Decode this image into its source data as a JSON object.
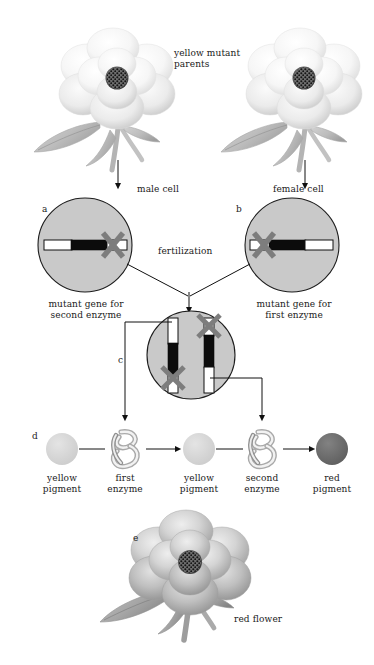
{
  "figure": {
    "domain": "biology-genetics-diagram",
    "title_note": "Complementation of two yellow mutant parents producing a red-flowered offspring"
  },
  "labels": {
    "parents": "yellow mutant\nparents",
    "male_cell": "male cell",
    "female_cell": "female cell",
    "fertilization": "fertilization",
    "mutant_second": "mutant gene for\nsecond enzyme",
    "mutant_first": "mutant gene for\nfirst enzyme",
    "red_flower": "red flower"
  },
  "panel_tags": {
    "a": "a",
    "b": "b",
    "c": "c",
    "d": "d",
    "e": "e"
  },
  "pathway": {
    "steps": [
      {
        "name": "yellow-pigment-1",
        "label": "yellow\npigment",
        "kind": "pigment",
        "color": "#d6d6d6"
      },
      {
        "name": "first-enzyme",
        "label": "first\nenzyme",
        "kind": "enzyme"
      },
      {
        "name": "yellow-pigment-2",
        "label": "yellow\npigment",
        "kind": "pigment",
        "color": "#d6d6d6"
      },
      {
        "name": "second-enzyme",
        "label": "second\nenzyme",
        "kind": "enzyme"
      },
      {
        "name": "red-pigment",
        "label": "red\npigment",
        "kind": "pigment",
        "color": "#6f6f6f"
      }
    ]
  },
  "cells": {
    "male": {
      "tag": "a",
      "caption": "mutant gene for\nsecond enzyme",
      "chromosome_orientation": "horizontal",
      "mutation_x_side": "right"
    },
    "female": {
      "tag": "b",
      "caption": "mutant gene for\nfirst enzyme",
      "chromosome_orientation": "horizontal",
      "mutation_x_side": "left"
    },
    "zygote": {
      "tag": "c",
      "chromosome_orientation": "vertical",
      "left_chromosome_x_position": "bottom",
      "right_chromosome_x_position": "top"
    }
  },
  "colors": {
    "cell_fill": "#c9c9c9",
    "x_mark": "#7d7d7d",
    "chromosome_dark": "#0c0c0c",
    "chromosome_light": "#ffffff",
    "yellow_pigment": "#d6d6d6",
    "red_pigment": "#6f6f6f",
    "stroke": "#101010"
  }
}
